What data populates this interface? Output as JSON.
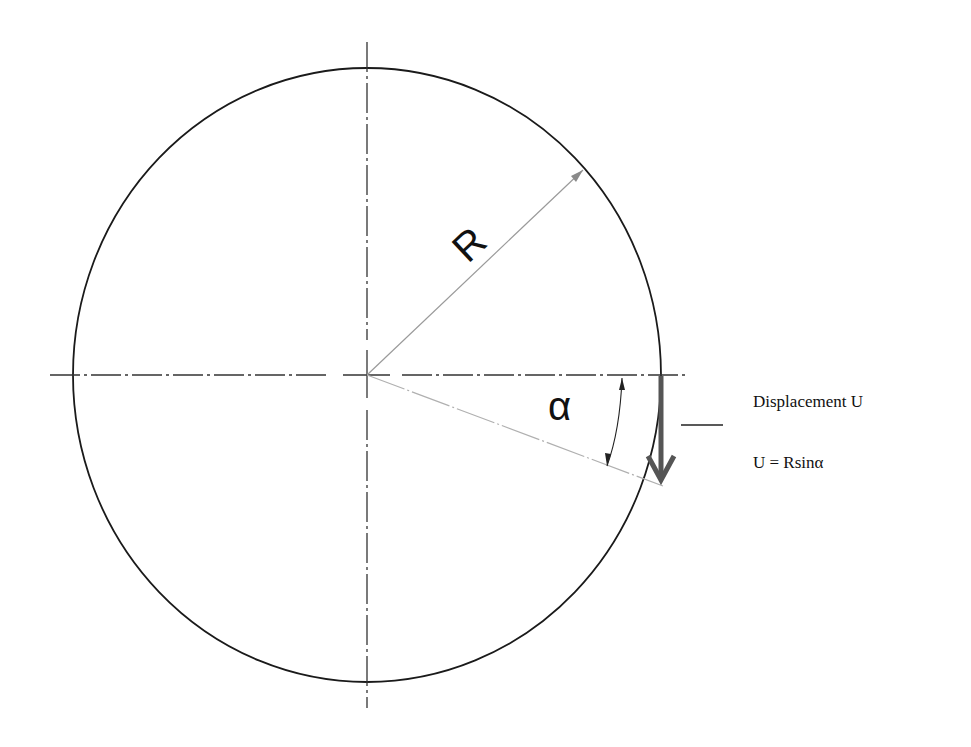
{
  "diagram": {
    "type": "geometry",
    "labels": {
      "radius": "R",
      "angle": "α"
    },
    "annotations": {
      "displacement": "Displacement U",
      "formula": "U = Rsinα"
    },
    "colors": {
      "outline": "#1a1a1a",
      "centerline": "#333333",
      "radius_line": "#9a9a9a",
      "displacement_arrow": "#555555"
    }
  }
}
